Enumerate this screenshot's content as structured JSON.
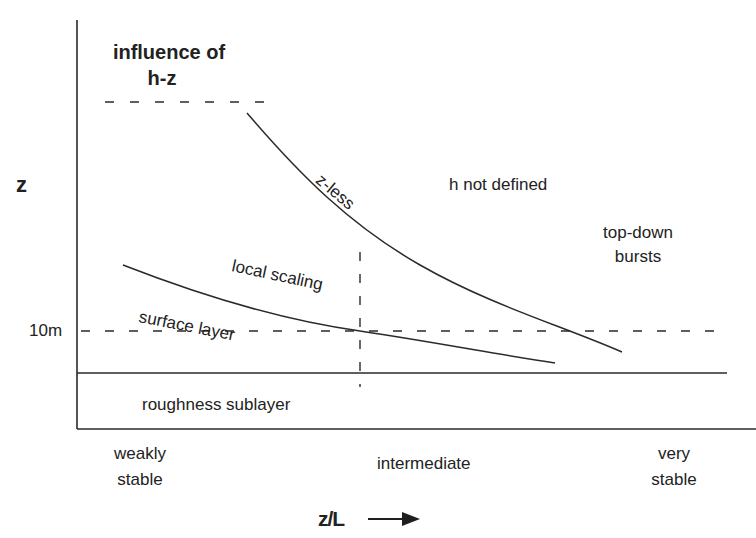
{
  "diagram": {
    "type": "regime-diagram",
    "axes": {
      "y_label": "z",
      "x_label": "z/L",
      "x_arrow": "right-arrow",
      "y_tick": "10m"
    },
    "x_categories": {
      "left": [
        "weakly",
        "stable"
      ],
      "middle": "intermediate",
      "right": [
        "very",
        "stable"
      ]
    },
    "regions": {
      "influence": [
        "influence of",
        "h-z"
      ],
      "z_less": "z-less",
      "h_not_defined": "h not defined",
      "top_down": [
        "top-down",
        "bursts"
      ],
      "local_scaling": "local scaling",
      "surface_layer": "surface layer",
      "roughness_sublayer": "roughness sublayer"
    },
    "colors": {
      "line": "#2a2a2a",
      "text": "#222222",
      "background": "#ffffff"
    }
  }
}
